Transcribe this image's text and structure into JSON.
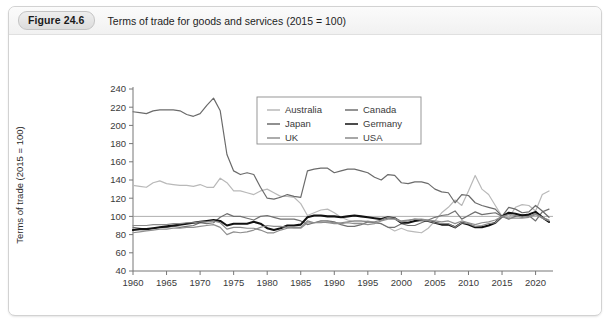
{
  "figure": {
    "badge": "Figure 24.6",
    "title": "Terms of trade for goods and services (2015  =  100)"
  },
  "source_note": "",
  "chart_data": {
    "type": "line",
    "title": "Terms of trade for goods and services (2015 = 100)",
    "xlabel": "",
    "ylabel": "Terms of trade (2015 = 100)",
    "xlim": [
      1960,
      2022
    ],
    "ylim": [
      40,
      240
    ],
    "ytick_step": 20,
    "xtick_step": 5,
    "yticks": [
      40,
      60,
      80,
      100,
      120,
      140,
      160,
      180,
      200,
      220,
      240
    ],
    "xticks": [
      1960,
      1965,
      1970,
      1975,
      1980,
      1985,
      1990,
      1995,
      2000,
      2005,
      2010,
      2015,
      2020
    ],
    "grid": false,
    "reference_line": 100,
    "legend_position": "top-center",
    "x": [
      1960,
      1961,
      1962,
      1963,
      1964,
      1965,
      1966,
      1967,
      1968,
      1969,
      1970,
      1971,
      1972,
      1973,
      1974,
      1975,
      1976,
      1977,
      1978,
      1979,
      1980,
      1981,
      1982,
      1983,
      1984,
      1985,
      1986,
      1987,
      1988,
      1989,
      1990,
      1991,
      1992,
      1993,
      1994,
      1995,
      1996,
      1997,
      1998,
      1999,
      2000,
      2001,
      2002,
      2003,
      2004,
      2005,
      2006,
      2007,
      2008,
      2009,
      2010,
      2011,
      2012,
      2013,
      2014,
      2015,
      2016,
      2017,
      2018,
      2019,
      2020,
      2021,
      2022
    ],
    "series": [
      {
        "name": "Australia",
        "color": "#b9b9b9",
        "width": 1.2,
        "values": [
          134,
          133,
          132,
          137,
          139,
          136,
          135,
          134,
          134,
          133,
          135,
          132,
          132,
          142,
          137,
          128,
          128,
          126,
          124,
          128,
          130,
          126,
          122,
          122,
          121,
          114,
          101,
          104,
          107,
          108,
          104,
          99,
          96,
          94,
          94,
          95,
          93,
          92,
          88,
          84,
          87,
          84,
          83,
          82,
          87,
          95,
          104,
          110,
          118,
          112,
          128,
          145,
          130,
          124,
          112,
          100,
          98,
          110,
          113,
          112,
          106,
          124,
          128
        ]
      },
      {
        "name": "Canada",
        "color": "#707070",
        "width": 1.2,
        "values": [
          88,
          87,
          86,
          87,
          88,
          88,
          89,
          88,
          89,
          90,
          93,
          92,
          93,
          99,
          103,
          100,
          100,
          98,
          96,
          100,
          101,
          99,
          97,
          97,
          97,
          95,
          91,
          93,
          95,
          95,
          94,
          91,
          89,
          89,
          91,
          94,
          93,
          92,
          88,
          88,
          92,
          90,
          90,
          93,
          96,
          99,
          101,
          102,
          106,
          97,
          101,
          105,
          102,
          103,
          104,
          100,
          97,
          100,
          102,
          101,
          95,
          105,
          108
        ]
      },
      {
        "name": "Japan",
        "color": "#6b6b6b",
        "width": 1.2,
        "values": [
          215,
          214,
          213,
          216,
          217,
          217,
          217,
          216,
          212,
          210,
          213,
          222,
          230,
          216,
          168,
          150,
          146,
          148,
          146,
          132,
          120,
          119,
          121,
          124,
          122,
          121,
          150,
          152,
          153,
          153,
          148,
          150,
          152,
          152,
          150,
          148,
          143,
          140,
          146,
          145,
          137,
          136,
          138,
          138,
          136,
          130,
          127,
          126,
          115,
          124,
          123,
          115,
          112,
          110,
          108,
          100,
          110,
          108,
          104,
          105,
          112,
          106,
          99
        ]
      },
      {
        "name": "Germany",
        "color": "#111111",
        "width": 2.1,
        "values": [
          85,
          86,
          86,
          87,
          88,
          89,
          90,
          91,
          92,
          93,
          94,
          95,
          96,
          95,
          90,
          92,
          92,
          92,
          94,
          92,
          87,
          85,
          87,
          90,
          90,
          91,
          99,
          101,
          101,
          100,
          100,
          99,
          100,
          101,
          100,
          99,
          98,
          97,
          99,
          98,
          93,
          93,
          95,
          96,
          95,
          93,
          91,
          91,
          88,
          93,
          91,
          88,
          88,
          90,
          93,
          100,
          104,
          103,
          101,
          102,
          105,
          99,
          94
        ]
      },
      {
        "name": "UK",
        "color": "#909090",
        "width": 1.2,
        "values": [
          82,
          83,
          84,
          85,
          86,
          86,
          87,
          87,
          88,
          88,
          89,
          90,
          91,
          88,
          80,
          83,
          82,
          83,
          85,
          88,
          90,
          89,
          89,
          88,
          87,
          87,
          93,
          93,
          94,
          93,
          92,
          92,
          93,
          92,
          92,
          91,
          92,
          95,
          97,
          97,
          94,
          95,
          97,
          97,
          96,
          95,
          94,
          95,
          92,
          95,
          93,
          91,
          93,
          94,
          96,
          100,
          98,
          98,
          98,
          99,
          102,
          98,
          95
        ]
      },
      {
        "name": "USA",
        "color": "#8a8a8a",
        "width": 1.2,
        "values": [
          90,
          90,
          90,
          91,
          91,
          91,
          92,
          92,
          93,
          93,
          94,
          94,
          95,
          93,
          86,
          88,
          88,
          87,
          87,
          85,
          82,
          82,
          85,
          87,
          88,
          88,
          95,
          93,
          93,
          94,
          93,
          93,
          94,
          95,
          95,
          94,
          94,
          96,
          99,
          98,
          95,
          96,
          97,
          96,
          95,
          93,
          92,
          92,
          88,
          93,
          92,
          89,
          90,
          92,
          93,
          100,
          102,
          101,
          99,
          100,
          103,
          99,
          96
        ]
      }
    ]
  }
}
